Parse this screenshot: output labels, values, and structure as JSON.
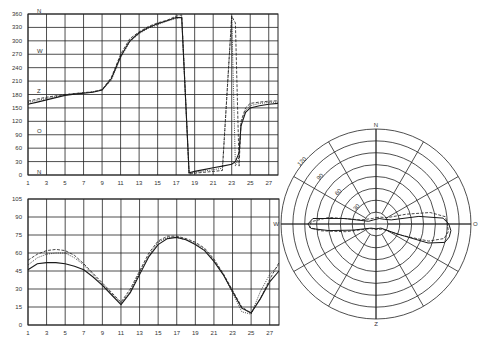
{
  "chart_data": [
    {
      "id": "top-line-chart",
      "type": "line",
      "title": "",
      "xlabel": "",
      "ylabel": "",
      "x_ticks": [
        "1",
        "3",
        "5",
        "7",
        "9",
        "11",
        "13",
        "15",
        "17",
        "19",
        "21",
        "23",
        "25",
        "27"
      ],
      "y_ticks": [
        "0",
        "30",
        "60",
        "90",
        "120",
        "150",
        "180",
        "210",
        "240",
        "270",
        "300",
        "330",
        "360"
      ],
      "ylim": [
        0,
        360
      ],
      "xlim": [
        1,
        28
      ],
      "grid": true,
      "annotations": [
        {
          "text": "N",
          "y": 360
        },
        {
          "text": "W",
          "y": 270
        },
        {
          "text": "Z",
          "y": 180
        },
        {
          "text": "O",
          "y": 90
        },
        {
          "text": "N",
          "y": 0
        }
      ],
      "x": [
        1,
        2,
        3,
        4,
        5,
        6,
        7,
        8,
        9,
        10,
        11,
        12,
        13,
        14,
        15,
        16,
        17,
        17.6,
        18.4,
        19,
        20,
        21,
        22,
        23,
        23.4,
        23.8,
        24,
        24.5,
        25,
        26,
        27,
        28
      ],
      "series": [
        {
          "name": "series-1",
          "style": "solid",
          "values": [
            158,
            163,
            168,
            173,
            178,
            181,
            183,
            185,
            190,
            215,
            265,
            300,
            318,
            330,
            338,
            345,
            352,
            352,
            5,
            8,
            12,
            16,
            20,
            24,
            30,
            50,
            110,
            140,
            150,
            155,
            158,
            160
          ]
        },
        {
          "name": "series-2",
          "style": "dashed",
          "values": [
            165,
            170,
            174,
            177,
            180,
            182,
            184,
            186,
            191,
            218,
            270,
            305,
            320,
            332,
            340,
            346,
            355,
            358,
            2,
            4,
            6,
            8,
            10,
            355,
            340,
            20,
            120,
            150,
            160,
            163,
            165,
            166
          ]
        },
        {
          "name": "series-3",
          "style": "dotted",
          "values": [
            162,
            167,
            171,
            175,
            179,
            182,
            184,
            186,
            190,
            212,
            262,
            298,
            316,
            328,
            336,
            344,
            350,
            354,
            3,
            6,
            9,
            12,
            15,
            355,
            20,
            40,
            115,
            145,
            155,
            160,
            162,
            163
          ]
        }
      ]
    },
    {
      "id": "bottom-line-chart",
      "type": "line",
      "title": "",
      "xlabel": "",
      "ylabel": "",
      "x_ticks": [
        "1",
        "3",
        "5",
        "7",
        "9",
        "11",
        "13",
        "15",
        "17",
        "19",
        "21",
        "23",
        "25",
        "27"
      ],
      "y_ticks": [
        "0",
        "15",
        "30",
        "45",
        "60",
        "75",
        "90",
        "105"
      ],
      "ylim": [
        0,
        105
      ],
      "xlim": [
        1,
        28
      ],
      "grid": true,
      "x": [
        1,
        2,
        3,
        4,
        5,
        6,
        7,
        8,
        9,
        10,
        11,
        12,
        13,
        14,
        15,
        16,
        17,
        18,
        19,
        20,
        21,
        22,
        23,
        24,
        25,
        26,
        27,
        28
      ],
      "series": [
        {
          "name": "series-1",
          "style": "solid",
          "values": [
            46,
            51,
            52,
            52,
            51,
            49,
            46,
            40,
            33,
            25,
            17,
            27,
            42,
            57,
            67,
            72,
            73,
            71,
            67,
            62,
            53,
            42,
            28,
            14,
            10,
            22,
            36,
            45
          ]
        },
        {
          "name": "series-2",
          "style": "dashed",
          "values": [
            54,
            59,
            62,
            63,
            62,
            58,
            51,
            43,
            35,
            27,
            19,
            30,
            45,
            60,
            70,
            74,
            74,
            72,
            69,
            64,
            55,
            43,
            29,
            15,
            10,
            22,
            38,
            52
          ]
        },
        {
          "name": "series-3",
          "style": "dotted",
          "values": [
            50,
            56,
            59,
            60,
            60,
            56,
            50,
            42,
            34,
            26,
            18,
            28,
            44,
            58,
            69,
            73,
            73,
            71,
            68,
            63,
            54,
            42,
            27,
            11,
            9,
            28,
            42,
            50
          ]
        }
      ]
    },
    {
      "id": "polar-chart",
      "type": "polar",
      "title": "",
      "direction_labels": {
        "top": "N",
        "right": "O",
        "bottom": "Z",
        "left": "W"
      },
      "ring_labels": [
        "30",
        "60",
        "90",
        "120"
      ],
      "rings": 8,
      "spokes": 12,
      "rmax": 120,
      "grid": true,
      "series": [
        {
          "name": "series-1",
          "style": "solid",
          "points_deg_r": [
            [
              0,
              6
            ],
            [
              30,
              8
            ],
            [
              60,
              12
            ],
            [
              75,
              20
            ],
            [
              80,
              55
            ],
            [
              85,
              85
            ],
            [
              90,
              92
            ],
            [
              95,
              95
            ],
            [
              100,
              94
            ],
            [
              105,
              90
            ],
            [
              110,
              70
            ],
            [
              115,
              30
            ],
            [
              130,
              8
            ],
            [
              180,
              6
            ],
            [
              230,
              8
            ],
            [
              255,
              30
            ],
            [
              262,
              60
            ],
            [
              266,
              82
            ],
            [
              270,
              86
            ],
            [
              275,
              80
            ],
            [
              280,
              40
            ],
            [
              290,
              10
            ],
            [
              330,
              6
            ],
            [
              360,
              6
            ]
          ]
        },
        {
          "name": "series-2",
          "style": "dashed",
          "points_deg_r": [
            [
              0,
              8
            ],
            [
              30,
              10
            ],
            [
              60,
              16
            ],
            [
              72,
              40
            ],
            [
              78,
              70
            ],
            [
              84,
              88
            ],
            [
              90,
              90
            ],
            [
              96,
              92
            ],
            [
              102,
              88
            ],
            [
              108,
              70
            ],
            [
              114,
              35
            ],
            [
              130,
              10
            ],
            [
              180,
              7
            ],
            [
              230,
              9
            ],
            [
              256,
              40
            ],
            [
              263,
              70
            ],
            [
              267,
              84
            ],
            [
              272,
              82
            ],
            [
              278,
              60
            ],
            [
              285,
              20
            ],
            [
              330,
              8
            ],
            [
              360,
              8
            ]
          ]
        }
      ]
    }
  ]
}
